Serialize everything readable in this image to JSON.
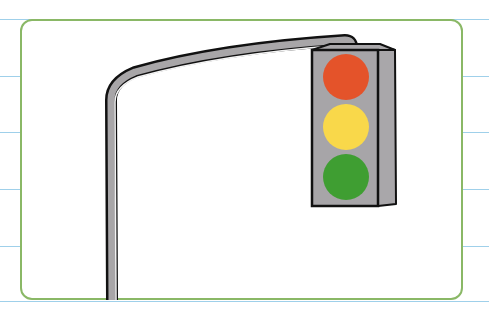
{
  "illustration": {
    "subject": "traffic-light",
    "colors": {
      "card_border": "#8ab866",
      "ruled_lines": "#9fd0ea",
      "housing": "#a7a5a8",
      "pole": "#a8a6a8",
      "outline": "#111111",
      "red_light": "#e4532a",
      "yellow_light": "#f9d84a",
      "green_light": "#3f9e32"
    },
    "lights": [
      "red",
      "yellow",
      "green"
    ],
    "ruled_line_ys": [
      19,
      76,
      132,
      189,
      246,
      302
    ]
  }
}
